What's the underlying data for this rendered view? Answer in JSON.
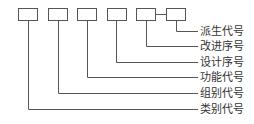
{
  "diagram": {
    "type": "code-structure",
    "boxes": [
      {
        "id": "box-1",
        "label": ""
      },
      {
        "id": "box-2",
        "label": ""
      },
      {
        "id": "box-3",
        "label": ""
      },
      {
        "id": "box-4",
        "label": ""
      },
      {
        "id": "box-5",
        "label": ""
      },
      {
        "id": "box-6",
        "label": ""
      }
    ],
    "labels": [
      "派生代号",
      "改进序号",
      "设计序号",
      "功能代号",
      "组别代号",
      "类别代号"
    ],
    "colors": {
      "line": "#555555",
      "text": "#333333",
      "background": "#ffffff"
    }
  }
}
